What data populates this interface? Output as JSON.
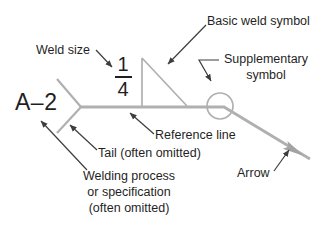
{
  "diagram": {
    "weld_spec": {
      "tail_code": "A–2",
      "size_numerator": "1",
      "size_denominator": "4"
    },
    "callouts": {
      "basic_weld_symbol": "Basic weld symbol",
      "weld_size": "Weld size",
      "supplementary_symbol": [
        "Supplementary",
        "symbol"
      ],
      "reference_line": "Reference line",
      "tail": "Tail (often omitted)",
      "welding_process": [
        "Welding process",
        "or specification",
        "(often omitted)"
      ],
      "arrow": "Arrow"
    }
  },
  "colors": {
    "background": "#ffffff",
    "diagram_line": "#b0b0b0",
    "arrowhead_fill": "#a3a3a3",
    "callout_line": "#3d3d3d",
    "text": "#1f1f1f"
  }
}
